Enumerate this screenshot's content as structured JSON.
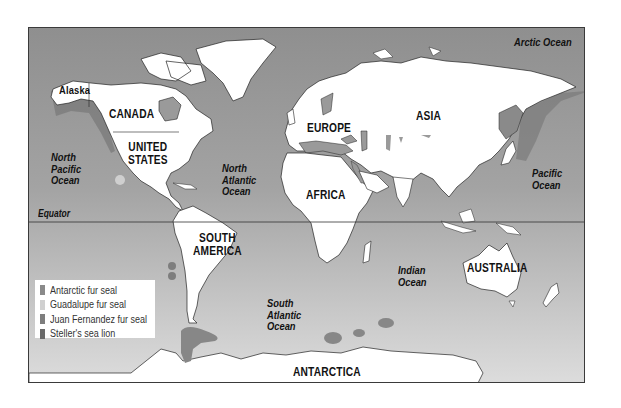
{
  "map": {
    "type": "world distribution map",
    "colors": {
      "ocean_top": "#8f8f8f",
      "ocean_bottom": "#dcdcdc",
      "land": "#ffffff",
      "border": "#3a3a3a"
    },
    "continents": {
      "alaska": "Alaska",
      "canada": "CANADA",
      "united_states_line1": "UNITED",
      "united_states_line2": "STATES",
      "europe": "EUROPE",
      "asia": "ASIA",
      "africa": "AFRICA",
      "south_america_line1": "SOUTH",
      "south_america_line2": "AMERICA",
      "australia": "AUSTRALIA",
      "antarctica": "ANTARCTICA"
    },
    "oceans": {
      "arctic": "Arctic Ocean",
      "north_pacific_line1": "North",
      "north_pacific_line2": "Pacific",
      "north_pacific_line3": "Ocean",
      "north_atlantic_line1": "North",
      "north_atlantic_line2": "Atlantic",
      "north_atlantic_line3": "Ocean",
      "pacific_line1": "Pacific",
      "pacific_line2": "Ocean",
      "south_atlantic_line1": "South",
      "south_atlantic_line2": "Atlantic",
      "south_atlantic_line3": "Ocean",
      "indian_line1": "Indian",
      "indian_line2": "Ocean"
    },
    "equator": "Equator"
  },
  "legend": {
    "items": [
      {
        "label": "Antarctic fur seal",
        "color": "#8a8a8a"
      },
      {
        "label": "Guadalupe fur seal",
        "color": "#d0d0d0"
      },
      {
        "label": "Juan Fernandez fur seal",
        "color": "#7e7e7e"
      },
      {
        "label": "Steller's sea lion",
        "color": "#6a6a6a"
      }
    ]
  }
}
